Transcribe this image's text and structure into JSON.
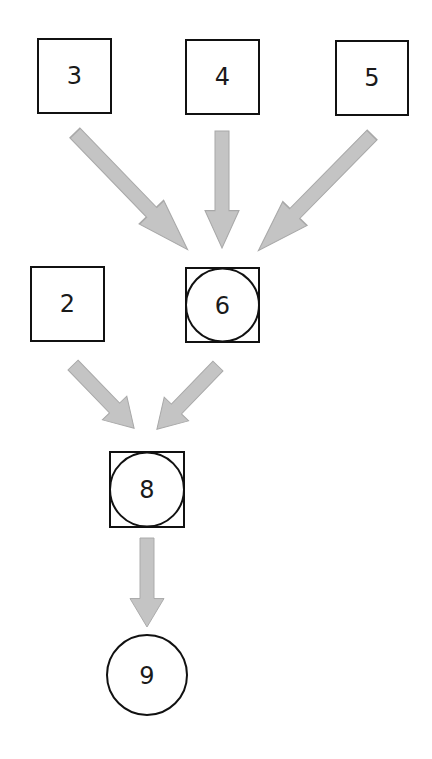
{
  "diagram": {
    "arrow_color": "#c4c4c4",
    "arrow_stroke": "#a8a8a8",
    "node_stroke": "#111111",
    "nodes": [
      {
        "id": "3",
        "label": "3",
        "shape": "square",
        "x": 38,
        "y": 39,
        "size": 73
      },
      {
        "id": "4",
        "label": "4",
        "shape": "square",
        "x": 186,
        "y": 40,
        "size": 73
      },
      {
        "id": "5",
        "label": "5",
        "shape": "square",
        "x": 336,
        "y": 41,
        "size": 73
      },
      {
        "id": "2",
        "label": "2",
        "shape": "square",
        "x": 31,
        "y": 267,
        "size": 73
      },
      {
        "id": "6",
        "label": "6",
        "shape": "square-circle",
        "x": 186,
        "y": 268,
        "size": 73
      },
      {
        "id": "8",
        "label": "8",
        "shape": "square-circle",
        "x": 110,
        "y": 452,
        "size": 74
      },
      {
        "id": "9",
        "label": "9",
        "shape": "circle",
        "cx": 147,
        "cy": 675,
        "r": 40
      }
    ],
    "edges": [
      {
        "from": "3",
        "to": "6"
      },
      {
        "from": "4",
        "to": "6"
      },
      {
        "from": "5",
        "to": "6"
      },
      {
        "from": "2",
        "to": "8"
      },
      {
        "from": "6",
        "to": "8"
      },
      {
        "from": "8",
        "to": "9"
      }
    ]
  }
}
